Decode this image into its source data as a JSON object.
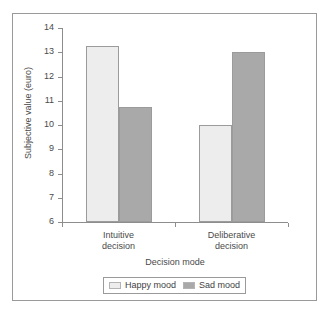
{
  "chart_data": {
    "type": "bar",
    "title": "",
    "xlabel": "Decision mode",
    "ylabel": "Subjective value (euro)",
    "categories": [
      "Intuitive decision",
      "Deliberative decision"
    ],
    "category_lines": [
      [
        "Intuitive",
        "decision"
      ],
      [
        "Deliberative",
        "decision"
      ]
    ],
    "series": [
      {
        "name": "Happy mood",
        "values": [
          13.25,
          10.0
        ],
        "color": "#ededed"
      },
      {
        "name": "Sad mood",
        "values": [
          10.75,
          13.0
        ],
        "color": "#a9a9a9"
      }
    ],
    "ylim": [
      6,
      14
    ],
    "yticks": [
      14,
      13,
      12,
      11,
      10,
      9,
      8,
      7,
      6
    ],
    "ytick_labels": [
      "14",
      "13",
      "12",
      "11",
      "10",
      "9",
      "8",
      "7",
      "6"
    ],
    "grid": false,
    "legend_position": "bottom",
    "legend_entries": [
      "Happy mood",
      "Sad mood"
    ]
  },
  "figure": {
    "frame_color": "#9a9a9a",
    "axis_color": "#8d8d8d",
    "background": "#ffffff"
  }
}
